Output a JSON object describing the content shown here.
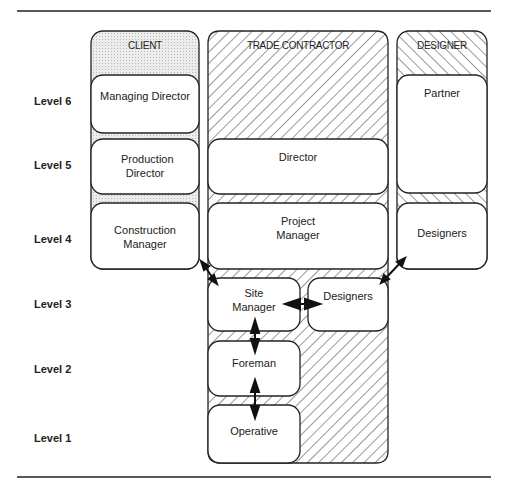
{
  "diagram": {
    "levels": [
      "Level 6",
      "Level 5",
      "Level 4",
      "Level 3",
      "Level 2",
      "Level 1"
    ],
    "columns": {
      "client": {
        "header": "CLIENT",
        "roles": [
          "Managing Director",
          "Production Director",
          "Construction Manager"
        ]
      },
      "trade_contractor": {
        "header": "TRADE CONTRACTOR",
        "roles": [
          "Director",
          "Project Manager",
          "Site Manager",
          "Designers",
          "Foreman",
          "Operative"
        ]
      },
      "designer": {
        "header": "DESIGNER",
        "roles": [
          "Partner",
          "Designers"
        ]
      }
    },
    "links": [
      {
        "from": "Construction Manager",
        "to": "Site Manager",
        "type": "double-arrow"
      },
      {
        "from": "Designers (Designer)",
        "to": "Designers (Trade Contractor)",
        "type": "double-arrow"
      },
      {
        "from": "Site Manager",
        "to": "Designers (Trade Contractor)",
        "type": "double-arrow"
      },
      {
        "from": "Site Manager",
        "to": "Foreman",
        "type": "double-arrow"
      },
      {
        "from": "Foreman",
        "to": "Operative",
        "type": "double-arrow"
      }
    ],
    "colors": {
      "line": "#222222",
      "client_fill": "#e6e6e6",
      "box_fill": "#ffffff"
    }
  }
}
